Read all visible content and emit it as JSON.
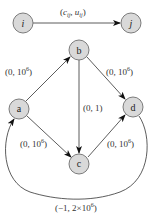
{
  "legend": {
    "from_node": "i",
    "to_node": "j",
    "label_open": "(",
    "label_c": "c",
    "label_c_sub": "ij",
    "label_sep": ", ",
    "label_u": "u",
    "label_u_sub": "ij",
    "label_close": ")"
  },
  "nodes": [
    {
      "id": "a",
      "label": "a"
    },
    {
      "id": "b",
      "label": "b"
    },
    {
      "id": "c",
      "label": "c"
    },
    {
      "id": "d",
      "label": "d"
    }
  ],
  "edges": [
    {
      "from": "a",
      "to": "b",
      "cost": "0",
      "cap_base": "10",
      "cap_exp": "6",
      "label_prefix": "(0, ",
      "label_suffix": ")"
    },
    {
      "from": "b",
      "to": "d",
      "cost": "0",
      "cap_base": "10",
      "cap_exp": "6",
      "label_prefix": "(0, ",
      "label_suffix": ")"
    },
    {
      "from": "b",
      "to": "c",
      "cost": "0",
      "cap": "1",
      "label": "(0, 1)"
    },
    {
      "from": "a",
      "to": "c",
      "cost": "0",
      "cap_base": "10",
      "cap_exp": "6",
      "label_prefix": "(0, ",
      "label_suffix": ")"
    },
    {
      "from": "d",
      "to": "c",
      "cost": "0",
      "cap_base": "10",
      "cap_exp": "6",
      "label_prefix": "(0, ",
      "label_suffix": ")"
    },
    {
      "from": "d",
      "to": "a",
      "cost": "−1",
      "cap_base": "2×10",
      "cap_exp": "6",
      "label_prefix": "(−1, ",
      "label_suffix": ")"
    }
  ],
  "colors": {
    "node_fill": "#d9d9d9",
    "node_stroke": "#6e6e6e",
    "edge": "#333333"
  }
}
